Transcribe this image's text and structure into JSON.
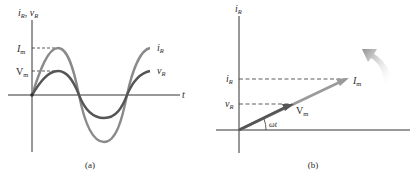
{
  "panel_a": {
    "caption": "(a)",
    "y_axis_label": "i",
    "y_axis_sub": "R",
    "y_axis_label2": "v",
    "y_axis_sub2": "R",
    "x_axis_label": "t",
    "im_label": "I",
    "im_sub": "m",
    "vm_label": "V",
    "vm_sub": "m",
    "curve_i_label": "i",
    "curve_i_sub": "R",
    "curve_v_label": "v",
    "curve_v_sub": "R",
    "colors": {
      "current_curve": "#8a8a8a",
      "voltage_curve": "#555555",
      "axis": "#333333"
    }
  },
  "panel_b": {
    "caption": "(b)",
    "y_axis_label": "i",
    "y_axis_sub": "R",
    "ir_tick_label": "i",
    "ir_tick_sub": "R",
    "vr_tick_label": "v",
    "vr_tick_sub": "R",
    "im_phasor_label": "I",
    "im_phasor_sub": "m",
    "vm_phasor_label": "V",
    "vm_phasor_sub": "m",
    "angle_label": "ωt",
    "colors": {
      "current_phasor": "#9a9a9a",
      "voltage_phasor": "#555555",
      "rotation_arrow": "#a0a0a0"
    }
  }
}
